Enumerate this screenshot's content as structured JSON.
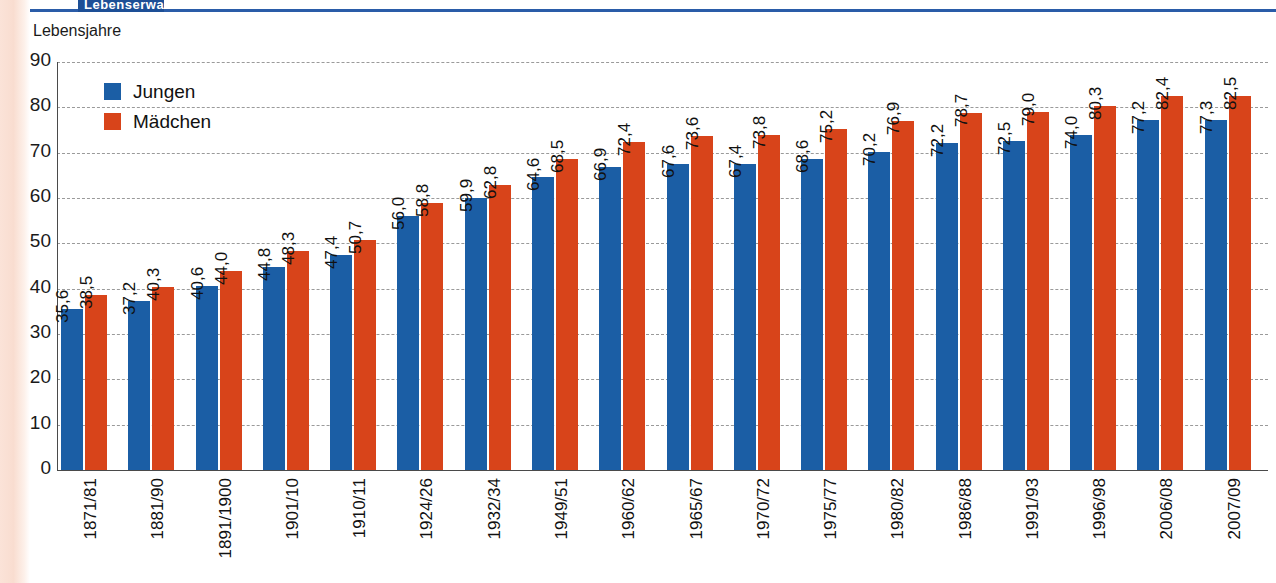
{
  "header": {
    "chip_label": "Lebenserwartung",
    "accent_color": "#2a5ca8"
  },
  "axis_title": "Lebensjahre",
  "legend": {
    "items": [
      {
        "label": "Jungen",
        "color": "#1b5ea5",
        "icon": "square-swatch-blue"
      },
      {
        "label": "Mädchen",
        "color": "#d8441a",
        "icon": "square-swatch-red"
      }
    ]
  },
  "chart_data": {
    "type": "bar",
    "title": "Lebenserwartung",
    "xlabel": "",
    "ylabel": "Lebensjahre",
    "ylim": [
      0,
      90
    ],
    "ytick_step": 10,
    "yticks": [
      "90",
      "80",
      "70",
      "60",
      "50",
      "40",
      "30",
      "20",
      "10",
      "0"
    ],
    "grid": true,
    "legend_position": "top-left",
    "decimal_separator": ",",
    "categories": [
      "1871/81",
      "1881/90",
      "1891/1900",
      "1901/10",
      "1910/11",
      "1924/26",
      "1932/34",
      "1949/51",
      "1960/62",
      "1965/67",
      "1970/72",
      "1975/77",
      "1980/82",
      "1986/88",
      "1991/93",
      "1996/98",
      "2006/08",
      "2007/09"
    ],
    "series": [
      {
        "name": "Jungen",
        "color": "#1b5ea5",
        "values": [
          35.6,
          37.2,
          40.6,
          44.8,
          47.4,
          56.0,
          59.9,
          64.6,
          66.9,
          67.6,
          67.4,
          68.6,
          70.2,
          72.2,
          72.5,
          74.0,
          77.2,
          77.3
        ],
        "labels": [
          "35,6",
          "37,2",
          "40,6",
          "44,8",
          "47,4",
          "56,0",
          "59,9",
          "64,6",
          "66,9",
          "67,6",
          "67,4",
          "68,6",
          "70,2",
          "72,2",
          "72,5",
          "74,0",
          "77,2",
          "77,3"
        ]
      },
      {
        "name": "Mädchen",
        "color": "#d8441a",
        "values": [
          38.5,
          40.3,
          44.0,
          48.3,
          50.7,
          58.8,
          62.8,
          68.5,
          72.4,
          73.6,
          73.8,
          75.2,
          76.9,
          78.7,
          79.0,
          80.3,
          82.4,
          82.5
        ],
        "labels": [
          "38,5",
          "40,3",
          "44,0",
          "48,3",
          "50,7",
          "58,8",
          "62,8",
          "68,5",
          "72,4",
          "73,6",
          "73,8",
          "75,2",
          "76,9",
          "78,7",
          "79,0",
          "80,3",
          "82,4",
          "82,5"
        ]
      }
    ]
  }
}
